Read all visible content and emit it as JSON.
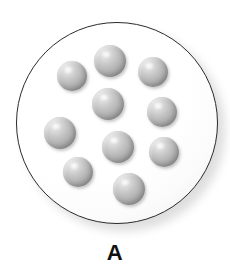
{
  "figure": {
    "label": "A",
    "caption_top": 240,
    "caption_font_size": 22
  },
  "colors": {
    "outline": "#2b2b2b",
    "vessel_fill": "#ffffff",
    "sphere_light": "#f2f2f2",
    "sphere_mid": "#b3b3b3",
    "sphere_dark": "#8c8c8c",
    "shadow": "#a9a9a9",
    "label_color": "#111111",
    "background": "#ffffff"
  },
  "vessel": {
    "cx": 117,
    "cy": 123,
    "r": 101,
    "stroke_width": 1.6
  },
  "shadow": {
    "cx": 124,
    "cy": 130,
    "r": 102
  },
  "spheres": [
    {
      "id": "sphere-1",
      "cx": 110,
      "cy": 61,
      "r": 16
    },
    {
      "id": "sphere-2",
      "cx": 72,
      "cy": 76,
      "r": 15
    },
    {
      "id": "sphere-3",
      "cx": 153,
      "cy": 72,
      "r": 15
    },
    {
      "id": "sphere-4",
      "cx": 108,
      "cy": 104,
      "r": 16
    },
    {
      "id": "sphere-5",
      "cx": 162,
      "cy": 112,
      "r": 15
    },
    {
      "id": "sphere-6",
      "cx": 60,
      "cy": 133,
      "r": 16
    },
    {
      "id": "sphere-7",
      "cx": 118,
      "cy": 147,
      "r": 16
    },
    {
      "id": "sphere-8",
      "cx": 164,
      "cy": 152,
      "r": 15
    },
    {
      "id": "sphere-9",
      "cx": 78,
      "cy": 172,
      "r": 15
    },
    {
      "id": "sphere-10",
      "cx": 129,
      "cy": 189,
      "r": 16
    }
  ],
  "sphere_count": 10
}
